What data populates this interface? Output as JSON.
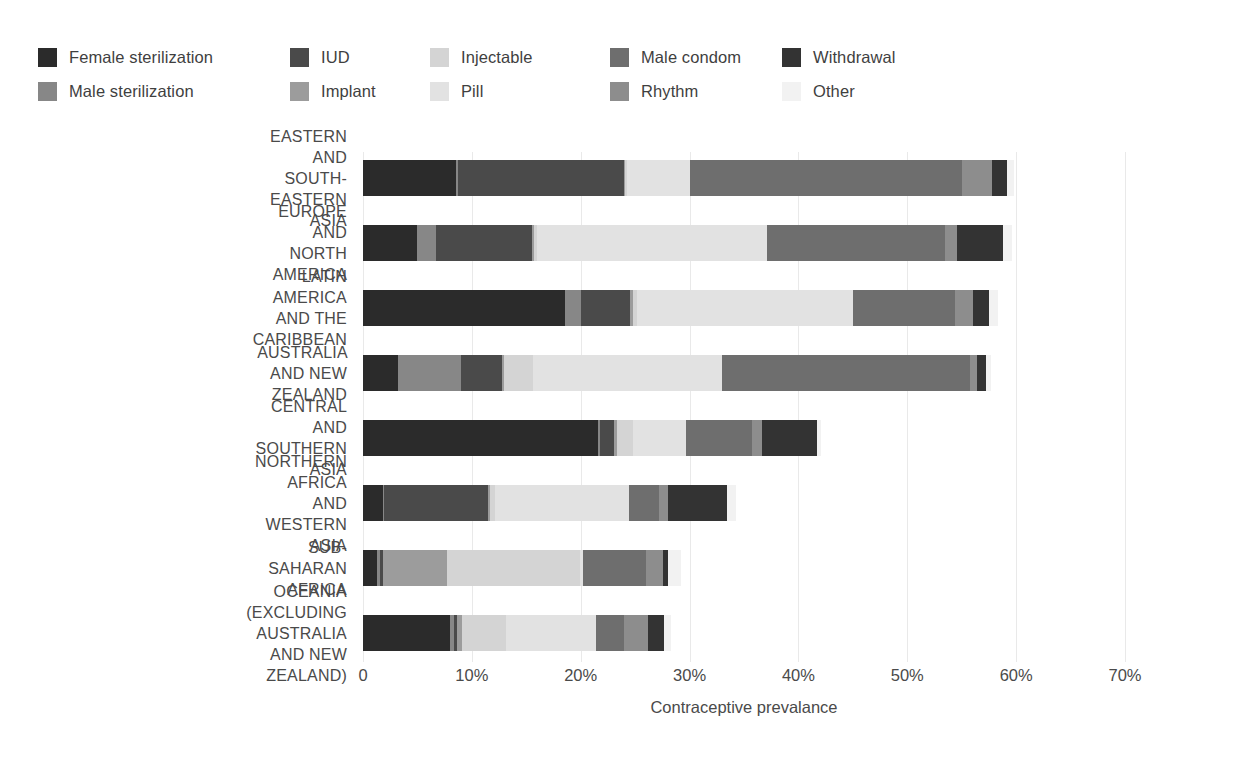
{
  "legend": {
    "items": [
      {
        "label": "Female sterilization",
        "color": "#2b2b2b",
        "icon": "legend-swatch-icon"
      },
      {
        "label": "Male sterilization",
        "color": "#878787",
        "icon": "legend-swatch-icon"
      },
      {
        "label": "IUD",
        "color": "#4a4a4a",
        "icon": "legend-swatch-icon"
      },
      {
        "label": "Implant",
        "color": "#9c9c9c",
        "icon": "legend-swatch-icon"
      },
      {
        "label": "Injectable",
        "color": "#d4d4d4",
        "icon": "legend-swatch-icon"
      },
      {
        "label": "Pill",
        "color": "#e2e2e2",
        "icon": "legend-swatch-icon"
      },
      {
        "label": "Male condom",
        "color": "#6e6e6e",
        "icon": "legend-swatch-icon"
      },
      {
        "label": "Rhythm",
        "color": "#8d8d8d",
        "icon": "legend-swatch-icon"
      },
      {
        "label": "Withdrawal",
        "color": "#333333",
        "icon": "legend-swatch-icon"
      },
      {
        "label": "Other",
        "color": "#f2f2f2",
        "icon": "legend-swatch-icon"
      }
    ]
  },
  "chart_data": {
    "type": "bar",
    "orientation": "horizontal",
    "stacked": true,
    "title": "",
    "xlabel": "Contraceptive prevalance",
    "ylabel": "",
    "xlim": [
      0,
      70
    ],
    "xticks": [
      0,
      10,
      20,
      30,
      40,
      50,
      60,
      70
    ],
    "xticklabels": [
      "0",
      "10%",
      "20%",
      "30%",
      "40%",
      "50%",
      "60%",
      "70%"
    ],
    "grid": "vertical",
    "legend_position": "top-left",
    "series": [
      {
        "name": "Female sterilization",
        "color": "#2b2b2b",
        "values": [
          8.5,
          5.0,
          18.6,
          3.2,
          21.6,
          1.8,
          1.3,
          8.0
        ]
      },
      {
        "name": "Male sterilization",
        "color": "#878787",
        "values": [
          0.2,
          1.7,
          1.4,
          5.8,
          0.2,
          0.1,
          0.3,
          0.4
        ]
      },
      {
        "name": "IUD",
        "color": "#4a4a4a",
        "values": [
          15.3,
          8.8,
          4.5,
          3.8,
          1.3,
          9.6,
          0.2,
          0.2
        ]
      },
      {
        "name": "Implant",
        "color": "#9c9c9c",
        "values": [
          0.1,
          0.2,
          0.3,
          0.2,
          0.2,
          0.2,
          5.9,
          0.5
        ]
      },
      {
        "name": "Injectable",
        "color": "#d4d4d4",
        "values": [
          0.2,
          0.3,
          0.4,
          2.6,
          1.5,
          0.4,
          12.2,
          4.0
        ]
      },
      {
        "name": "Pill",
        "color": "#e2e2e2",
        "values": [
          5.7,
          21.1,
          19.8,
          17.4,
          4.9,
          12.3,
          0.3,
          8.3
        ]
      },
      {
        "name": "Male condom",
        "color": "#6e6e6e",
        "values": [
          25.0,
          16.4,
          9.4,
          22.8,
          6.0,
          2.8,
          5.8,
          2.6
        ]
      },
      {
        "name": "Rhythm",
        "color": "#8d8d8d",
        "values": [
          2.8,
          1.1,
          1.6,
          0.6,
          1.0,
          0.8,
          1.6,
          2.2
        ]
      },
      {
        "name": "Withdrawal",
        "color": "#333333",
        "values": [
          1.4,
          4.2,
          1.5,
          0.8,
          5.0,
          5.4,
          0.4,
          1.5
        ]
      },
      {
        "name": "Other",
        "color": "#f2f2f2",
        "values": [
          0.6,
          0.8,
          0.8,
          0.5,
          0.4,
          0.9,
          1.2,
          0.6
        ]
      }
    ],
    "categories": [
      "EASTERN AND\nSOUTH-EASTERN ASIA",
      "EUROPE AND\nNORTH AMERICA",
      "LATIN AMERICA\nAND THE CARIBBEAN",
      "AUSTRALIA AND NEW ZEALAND",
      "CENTRAL AND\nSOUTHERN ASIA",
      "NORTHERN AFRICA\nAND WESTERN ASIA",
      "SUB-SAHARAN AFRICA",
      "OCEANIA (EXCLUDING\nAUSTRALIA AND NEW ZEALAND)"
    ],
    "totals": [
      59.8,
      59.6,
      58.3,
      57.7,
      42.1,
      34.3,
      29.2,
      28.3
    ]
  }
}
